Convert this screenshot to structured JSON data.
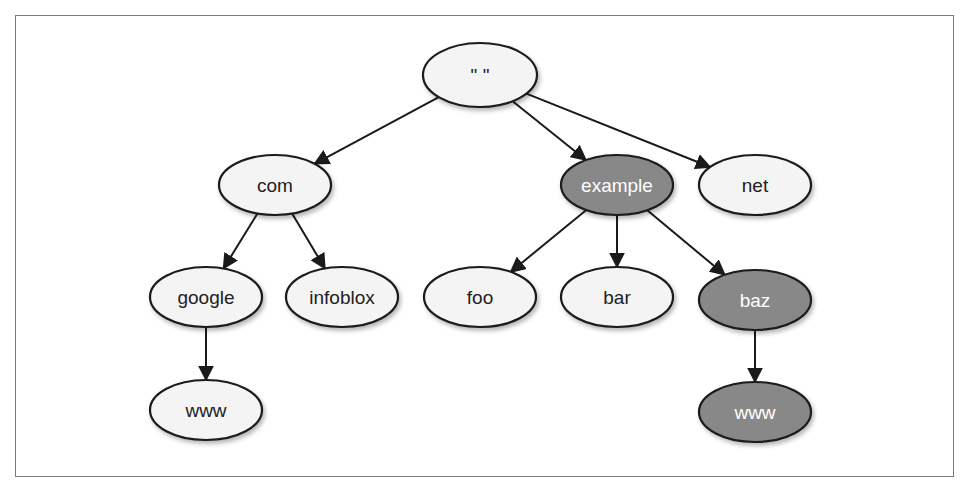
{
  "diagram": {
    "type": "tree",
    "colors": {
      "light_fill": "#f4f4f4",
      "dark_fill": "#888888",
      "stroke": "#1a1a1a",
      "light_text": "#222222",
      "dark_text": "#ffffff",
      "frame": "#7a7a7a"
    },
    "nodes": [
      {
        "id": "root",
        "label": "\" \"",
        "cx": 480,
        "cy": 75,
        "rx": 57,
        "ry": 32,
        "highlighted": false
      },
      {
        "id": "com",
        "label": "com",
        "cx": 275,
        "cy": 185,
        "rx": 56,
        "ry": 30,
        "highlighted": false
      },
      {
        "id": "example",
        "label": "example",
        "cx": 617,
        "cy": 185,
        "rx": 56,
        "ry": 30,
        "highlighted": true
      },
      {
        "id": "net",
        "label": "net",
        "cx": 755,
        "cy": 185,
        "rx": 56,
        "ry": 30,
        "highlighted": false
      },
      {
        "id": "google",
        "label": "google",
        "cx": 206,
        "cy": 297,
        "rx": 56,
        "ry": 30,
        "highlighted": false
      },
      {
        "id": "infoblox",
        "label": "infoblox",
        "cx": 342,
        "cy": 297,
        "rx": 56,
        "ry": 30,
        "highlighted": false
      },
      {
        "id": "foo",
        "label": "foo",
        "cx": 480,
        "cy": 297,
        "rx": 56,
        "ry": 30,
        "highlighted": false
      },
      {
        "id": "bar",
        "label": "bar",
        "cx": 617,
        "cy": 297,
        "rx": 56,
        "ry": 30,
        "highlighted": false
      },
      {
        "id": "baz",
        "label": "baz",
        "cx": 755,
        "cy": 300,
        "rx": 56,
        "ry": 30,
        "highlighted": true
      },
      {
        "id": "www-google",
        "label": "www",
        "cx": 206,
        "cy": 410,
        "rx": 56,
        "ry": 30,
        "highlighted": false
      },
      {
        "id": "www-baz",
        "label": "www",
        "cx": 755,
        "cy": 412,
        "rx": 56,
        "ry": 30,
        "highlighted": true
      }
    ],
    "edges": [
      {
        "from": "root",
        "to": "com"
      },
      {
        "from": "root",
        "to": "example"
      },
      {
        "from": "root",
        "to": "net"
      },
      {
        "from": "com",
        "to": "google"
      },
      {
        "from": "com",
        "to": "infoblox"
      },
      {
        "from": "example",
        "to": "foo"
      },
      {
        "from": "example",
        "to": "bar"
      },
      {
        "from": "example",
        "to": "baz"
      },
      {
        "from": "google",
        "to": "www-google"
      },
      {
        "from": "baz",
        "to": "www-baz"
      }
    ]
  }
}
